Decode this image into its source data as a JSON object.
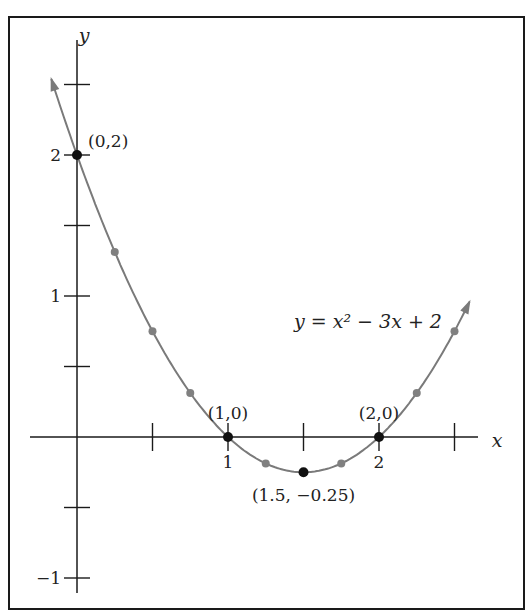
{
  "chart_data": {
    "type": "line",
    "title": "",
    "equation_label": "y = x² − 3x + 2",
    "function": "x^2 - 3x + 2",
    "xlabel": "x",
    "ylabel": "y",
    "xlim": [
      -0.2,
      2.75
    ],
    "ylim": [
      -1.05,
      2.75
    ],
    "x_ticks": [
      0.5,
      1,
      1.5,
      2,
      2.5
    ],
    "x_tick_labels": [
      {
        "value": 1,
        "label": "1"
      },
      {
        "value": 2,
        "label": "2"
      }
    ],
    "y_ticks": [
      -1,
      -0.5,
      0.5,
      1,
      1.5,
      2,
      2.5
    ],
    "y_tick_labels": [
      {
        "value": -1,
        "label": "−1"
      },
      {
        "value": 1,
        "label": "1"
      },
      {
        "value": 2,
        "label": "2"
      }
    ],
    "grid": false,
    "legend": "none",
    "curve_x_range": [
      -0.17,
      2.6
    ],
    "key_points": [
      {
        "x": 0,
        "y": 2,
        "label": "(0,2)"
      },
      {
        "x": 1,
        "y": 0,
        "label": "(1,0)"
      },
      {
        "x": 1.5,
        "y": -0.25,
        "label": "(1.5, −0.25)"
      },
      {
        "x": 2,
        "y": 0,
        "label": "(2,0)"
      }
    ],
    "minor_points": [
      {
        "x": 0.25,
        "y": 1.3125
      },
      {
        "x": 0.5,
        "y": 0.75
      },
      {
        "x": 0.75,
        "y": 0.3125
      },
      {
        "x": 1.25,
        "y": -0.1875
      },
      {
        "x": 1.75,
        "y": -0.1875
      },
      {
        "x": 2.25,
        "y": 0.3125
      },
      {
        "x": 2.5,
        "y": 0.75
      }
    ],
    "colors": {
      "axis": "#1a1a1a",
      "curve": "#7a7a7a",
      "key_point": "#111111",
      "minor_point": "#808080",
      "frame": "#1a1a1a"
    }
  }
}
